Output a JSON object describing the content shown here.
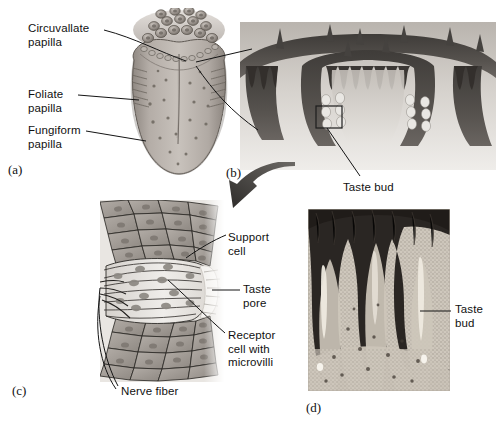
{
  "figure": {
    "width": 496,
    "height": 423,
    "background": "#ffffff"
  },
  "panels": [
    {
      "id": "a",
      "letter": "(a)",
      "caption": "Dorsal view of tongue showing papillae",
      "x": 8,
      "y": 162
    },
    {
      "id": "b",
      "letter": "(b)",
      "caption": "Section through circumvallate papilla",
      "x": 226,
      "y": 165
    },
    {
      "id": "c",
      "letter": "(c)",
      "caption": "Detail of a taste bud",
      "x": 12,
      "y": 383
    },
    {
      "id": "d",
      "letter": "(d)",
      "caption": "Light micrograph of taste buds",
      "x": 306,
      "y": 400
    }
  ],
  "labels": {
    "circuvallate_papilla": "Circuvallate\npapilla",
    "foliate_papilla": "Foliate\npapilla",
    "fungiform_papilla": "Fungiform\npapilla",
    "taste_bud_b": "Taste bud",
    "support_cell": "Support\ncell",
    "taste_pore": "Taste\npore",
    "receptor_cell": "Receptor\ncell with\nmicrovilli",
    "nerve_fiber": "Nerve fiber",
    "taste_bud_d": "Taste\nbud"
  },
  "label_positions": {
    "circuvallate_papilla": {
      "x": 28,
      "y": 22
    },
    "foliate_papilla": {
      "x": 28,
      "y": 88
    },
    "fungiform_papilla": {
      "x": 28,
      "y": 124
    },
    "taste_bud_b": {
      "x": 343,
      "y": 181
    },
    "support_cell": {
      "x": 228,
      "y": 231
    },
    "taste_pore": {
      "x": 243,
      "y": 283
    },
    "receptor_cell": {
      "x": 228,
      "y": 329
    },
    "nerve_fiber": {
      "x": 121,
      "y": 385
    },
    "taste_bud_d": {
      "x": 455,
      "y": 303
    }
  },
  "colors": {
    "ink": "#111111",
    "leader_line": "#1a1a1a",
    "tongue_light": "#cfc9c4",
    "tongue_mid": "#a9a29c",
    "tongue_dark": "#8a837d",
    "epithelium_dark": "#4a4a4a",
    "epithelium_mid": "#7d7a77",
    "tissue_light": "#d8d4cf",
    "taste_bud_cell": "#e8e6e2",
    "cell_body": "#c9c5c0",
    "nucleus": "#8d8983",
    "arrow": "#3d3d3d",
    "micrograph_dark": "#2b2724",
    "micrograph_light": "#cfc8bd"
  }
}
